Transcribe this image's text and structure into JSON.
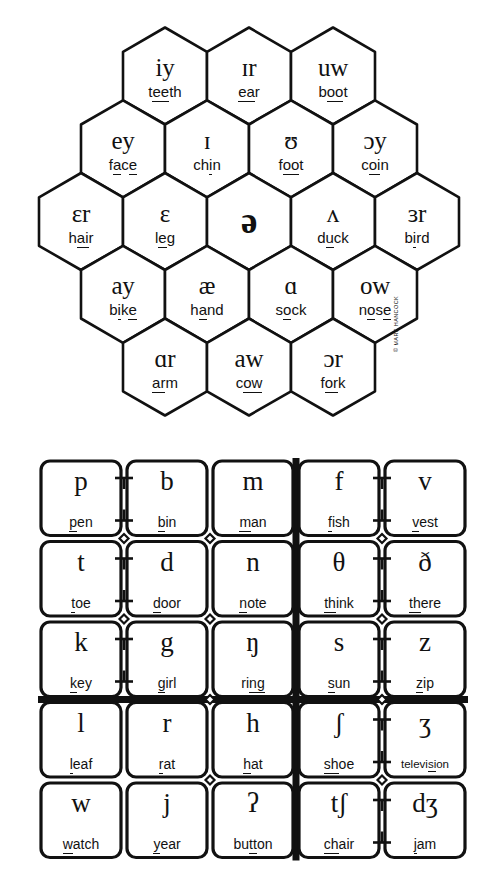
{
  "chart_title": "",
  "copyright": "© MARK HANCOCK",
  "colors": {
    "ink": "#111111",
    "paper": "#ffffff"
  },
  "vowels": {
    "name": "vowel-hexagon-chart",
    "rows": [
      {
        "count": 3,
        "cells": [
          {
            "symbol": "iy",
            "word": "teeth",
            "parts": [
              {
                "t": "t",
                "u": false
              },
              {
                "t": "ee",
                "u": true
              },
              {
                "t": "th",
                "u": false
              }
            ]
          },
          {
            "symbol": "ɪr",
            "word": "ear",
            "parts": [
              {
                "t": "ea",
                "u": true
              },
              {
                "t": "r",
                "u": false
              }
            ]
          },
          {
            "symbol": "uw",
            "word": "boot",
            "parts": [
              {
                "t": "b",
                "u": false
              },
              {
                "t": "oo",
                "u": true
              },
              {
                "t": "t",
                "u": false
              }
            ]
          }
        ]
      },
      {
        "count": 4,
        "cells": [
          {
            "symbol": "ey",
            "word": "face",
            "parts": [
              {
                "t": "f",
                "u": false
              },
              {
                "t": "a",
                "u": true
              },
              {
                "t": "c",
                "u": false
              },
              {
                "t": "e",
                "u": true
              }
            ]
          },
          {
            "symbol": "ɪ",
            "word": "chin",
            "parts": [
              {
                "t": "ch",
                "u": false
              },
              {
                "t": "i",
                "u": true
              },
              {
                "t": "n",
                "u": false
              }
            ]
          },
          {
            "symbol": "ʊ",
            "word": "foot",
            "parts": [
              {
                "t": "f",
                "u": false
              },
              {
                "t": "oo",
                "u": true
              },
              {
                "t": "t",
                "u": false
              }
            ]
          },
          {
            "symbol": "ɔy",
            "word": "coin",
            "parts": [
              {
                "t": "c",
                "u": false
              },
              {
                "t": "oi",
                "u": true
              },
              {
                "t": "n",
                "u": false
              }
            ]
          }
        ]
      },
      {
        "count": 5,
        "cells": [
          {
            "symbol": "ɛr",
            "word": "hair",
            "parts": [
              {
                "t": "h",
                "u": false
              },
              {
                "t": "ai",
                "u": true
              },
              {
                "t": "r",
                "u": false
              }
            ]
          },
          {
            "symbol": "ɛ",
            "word": "leg",
            "parts": [
              {
                "t": "l",
                "u": false
              },
              {
                "t": "e",
                "u": true
              },
              {
                "t": "g",
                "u": false
              }
            ]
          },
          {
            "symbol": "ə",
            "word": "",
            "parts": []
          },
          {
            "symbol": "ʌ",
            "word": "duck",
            "parts": [
              {
                "t": "d",
                "u": false
              },
              {
                "t": "u",
                "u": true
              },
              {
                "t": "ck",
                "u": false
              }
            ]
          },
          {
            "symbol": "ɜr",
            "word": "bird",
            "parts": [
              {
                "t": "b",
                "u": false
              },
              {
                "t": "i",
                "u": true
              },
              {
                "t": "rd",
                "u": false
              }
            ]
          }
        ]
      },
      {
        "count": 4,
        "cells": [
          {
            "symbol": "ay",
            "word": "bike",
            "parts": [
              {
                "t": "b",
                "u": false
              },
              {
                "t": "i",
                "u": true
              },
              {
                "t": "k",
                "u": false
              },
              {
                "t": "e",
                "u": true
              }
            ]
          },
          {
            "symbol": "æ",
            "word": "hand",
            "parts": [
              {
                "t": "h",
                "u": false
              },
              {
                "t": "a",
                "u": true
              },
              {
                "t": "nd",
                "u": false
              }
            ]
          },
          {
            "symbol": "ɑ",
            "word": "sock",
            "parts": [
              {
                "t": "s",
                "u": false
              },
              {
                "t": "o",
                "u": true
              },
              {
                "t": "ck",
                "u": false
              }
            ]
          },
          {
            "symbol": "ow",
            "word": "nose",
            "parts": [
              {
                "t": "n",
                "u": false
              },
              {
                "t": "o",
                "u": true
              },
              {
                "t": "s",
                "u": false
              },
              {
                "t": "e",
                "u": true
              }
            ]
          }
        ]
      },
      {
        "count": 3,
        "cells": [
          {
            "symbol": "ɑr",
            "word": "arm",
            "parts": [
              {
                "t": "ar",
                "u": true
              },
              {
                "t": "m",
                "u": false
              }
            ]
          },
          {
            "symbol": "aw",
            "word": "cow",
            "parts": [
              {
                "t": "c",
                "u": false
              },
              {
                "t": "ow",
                "u": true
              }
            ]
          },
          {
            "symbol": "ɔr",
            "word": "fork",
            "parts": [
              {
                "t": "f",
                "u": false
              },
              {
                "t": "or",
                "u": true
              },
              {
                "t": "k",
                "u": false
              }
            ]
          }
        ]
      }
    ]
  },
  "consonants": {
    "name": "consonant-grid-chart",
    "rows": [
      [
        {
          "symbol": "p",
          "word": "pen",
          "parts": [
            {
              "t": "p",
              "u": true
            },
            {
              "t": "en",
              "u": false
            }
          ],
          "pair": "left"
        },
        {
          "symbol": "b",
          "word": "bin",
          "parts": [
            {
              "t": "b",
              "u": true
            },
            {
              "t": "in",
              "u": false
            }
          ],
          "pair": "right"
        },
        {
          "symbol": "m",
          "word": "man",
          "parts": [
            {
              "t": "m",
              "u": true
            },
            {
              "t": "an",
              "u": false
            }
          ],
          "pair": "none"
        },
        {
          "symbol": "f",
          "word": "fish",
          "parts": [
            {
              "t": "f",
              "u": true
            },
            {
              "t": "ish",
              "u": false
            }
          ],
          "pair": "left"
        },
        {
          "symbol": "v",
          "word": "vest",
          "parts": [
            {
              "t": "v",
              "u": true
            },
            {
              "t": "est",
              "u": false
            }
          ],
          "pair": "right"
        }
      ],
      [
        {
          "symbol": "t",
          "word": "toe",
          "parts": [
            {
              "t": "t",
              "u": true
            },
            {
              "t": "oe",
              "u": false
            }
          ],
          "pair": "left"
        },
        {
          "symbol": "d",
          "word": "door",
          "parts": [
            {
              "t": "d",
              "u": true
            },
            {
              "t": "oor",
              "u": false
            }
          ],
          "pair": "right"
        },
        {
          "symbol": "n",
          "word": "note",
          "parts": [
            {
              "t": "n",
              "u": true
            },
            {
              "t": "ote",
              "u": false
            }
          ],
          "pair": "none"
        },
        {
          "symbol": "θ",
          "word": "think",
          "parts": [
            {
              "t": "th",
              "u": true
            },
            {
              "t": "ink",
              "u": false
            }
          ],
          "pair": "left"
        },
        {
          "symbol": "ð",
          "word": "there",
          "parts": [
            {
              "t": "th",
              "u": true
            },
            {
              "t": "ere",
              "u": false
            }
          ],
          "pair": "right"
        }
      ],
      [
        {
          "symbol": "k",
          "word": "key",
          "parts": [
            {
              "t": "k",
              "u": true
            },
            {
              "t": "ey",
              "u": false
            }
          ],
          "pair": "left"
        },
        {
          "symbol": "g",
          "word": "girl",
          "parts": [
            {
              "t": "g",
              "u": true
            },
            {
              "t": "irl",
              "u": false
            }
          ],
          "pair": "right"
        },
        {
          "symbol": "ŋ",
          "word": "ring",
          "parts": [
            {
              "t": "ri",
              "u": false
            },
            {
              "t": "ng",
              "u": true
            }
          ],
          "pair": "none"
        },
        {
          "symbol": "s",
          "word": "sun",
          "parts": [
            {
              "t": "s",
              "u": true
            },
            {
              "t": "un",
              "u": false
            }
          ],
          "pair": "left"
        },
        {
          "symbol": "z",
          "word": "zip",
          "parts": [
            {
              "t": "z",
              "u": true
            },
            {
              "t": "ip",
              "u": false
            }
          ],
          "pair": "right"
        }
      ],
      [
        {
          "symbol": "l",
          "word": "leaf",
          "parts": [
            {
              "t": "l",
              "u": true
            },
            {
              "t": "eaf",
              "u": false
            }
          ],
          "pair": "none"
        },
        {
          "symbol": "r",
          "word": "rat",
          "parts": [
            {
              "t": "r",
              "u": true
            },
            {
              "t": "at",
              "u": false
            }
          ],
          "pair": "none"
        },
        {
          "symbol": "h",
          "word": "hat",
          "parts": [
            {
              "t": "h",
              "u": true
            },
            {
              "t": "at",
              "u": false
            }
          ],
          "pair": "none"
        },
        {
          "symbol": "ʃ",
          "word": "shoe",
          "parts": [
            {
              "t": "sh",
              "u": true
            },
            {
              "t": "oe",
              "u": false
            }
          ],
          "pair": "left"
        },
        {
          "symbol": "ʒ",
          "word": "television",
          "parts": [
            {
              "t": "televi",
              "u": false
            },
            {
              "t": "si",
              "u": true
            },
            {
              "t": "on",
              "u": false
            }
          ],
          "pair": "right",
          "small": true
        }
      ],
      [
        {
          "symbol": "w",
          "word": "watch",
          "parts": [
            {
              "t": "w",
              "u": true
            },
            {
              "t": "atch",
              "u": false
            }
          ],
          "pair": "none"
        },
        {
          "symbol": "j",
          "word": "year",
          "parts": [
            {
              "t": "y",
              "u": true
            },
            {
              "t": "ear",
              "u": false
            }
          ],
          "pair": "none"
        },
        {
          "symbol": "ʔ",
          "word": "button",
          "parts": [
            {
              "t": "bu",
              "u": false
            },
            {
              "t": "tt",
              "u": true
            },
            {
              "t": "on",
              "u": false
            }
          ],
          "pair": "none"
        },
        {
          "symbol": "tʃ",
          "word": "chair",
          "parts": [
            {
              "t": "ch",
              "u": true
            },
            {
              "t": "air",
              "u": false
            }
          ],
          "pair": "left"
        },
        {
          "symbol": "dʒ",
          "word": "jam",
          "parts": [
            {
              "t": "j",
              "u": true
            },
            {
              "t": "am",
              "u": false
            }
          ],
          "pair": "right"
        }
      ]
    ]
  }
}
